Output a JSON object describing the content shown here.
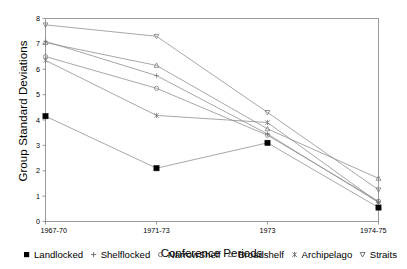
{
  "chart_data": {
    "type": "line",
    "title": "",
    "xlabel": "Conference Periods",
    "ylabel": "Group Standard Deviations",
    "categories": [
      "1967-70",
      "1971-73",
      "1973",
      "1974-75"
    ],
    "ylim": [
      0,
      8
    ],
    "yticks": [
      0,
      1,
      2,
      3,
      4,
      5,
      6,
      7,
      8
    ],
    "grid": false,
    "legend_position": "bottom",
    "series": [
      {
        "name": "Landlocked",
        "marker": "filled-square",
        "values": [
          4.15,
          2.1,
          3.1,
          0.55
        ]
      },
      {
        "name": "Shelflocked",
        "marker": "plus",
        "values": [
          7.1,
          5.75,
          3.45,
          0.75
        ]
      },
      {
        "name": "NarrowShelf",
        "marker": "circle",
        "values": [
          6.5,
          5.25,
          3.4,
          0.8
        ]
      },
      {
        "name": "Broadshelf",
        "marker": "triangle",
        "values": [
          7.05,
          6.15,
          3.65,
          1.7
        ]
      },
      {
        "name": "Archipelago",
        "marker": "asterisk",
        "values": [
          6.35,
          4.18,
          3.9,
          0.75
        ]
      },
      {
        "name": "Straits",
        "marker": "inverted-triangle",
        "values": [
          7.75,
          7.3,
          4.3,
          1.25
        ]
      }
    ]
  },
  "legend": {
    "items": [
      {
        "label": "Landlocked"
      },
      {
        "label": "Shelflocked"
      },
      {
        "label": "NarrowShelf"
      },
      {
        "label": "Broadshelf"
      },
      {
        "label": "Archipelago"
      },
      {
        "label": "Straits"
      }
    ]
  },
  "axes": {
    "y_title": "Group Standard Deviations",
    "x_title": "Conference Periods",
    "ytick_labels": [
      "0",
      "1",
      "2",
      "3",
      "4",
      "5",
      "6",
      "7",
      "8"
    ],
    "xtick_labels": [
      "1967-70",
      "1971-73",
      "1973",
      "1974-75"
    ]
  },
  "colors": {
    "line": "#8a8a8a",
    "axis": "#808080",
    "text": "#000000",
    "background": "#ffffff"
  }
}
